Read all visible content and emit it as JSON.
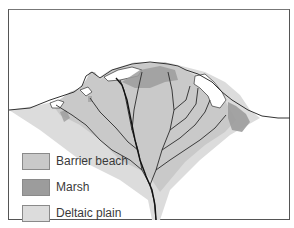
{
  "figure": {
    "colors": {
      "background": "#ffffff",
      "frame": "#555555",
      "barrier_beach": "#c9c9c9",
      "marsh": "#9c9c9c",
      "deltaic_plain": "#dcdcdc",
      "channels": "#2a2a2a"
    }
  },
  "legend": {
    "items": [
      {
        "label": "Barrier beach",
        "color": "#c9c9c9"
      },
      {
        "label": "Marsh",
        "color": "#9c9c9c"
      },
      {
        "label": "Deltaic plain",
        "color": "#dcdcdc"
      }
    ]
  }
}
